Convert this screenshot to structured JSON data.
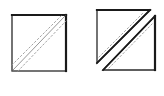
{
  "diagram": {
    "canvas": {
      "width": 164,
      "height": 96,
      "background": "#ffffff"
    },
    "colors": {
      "outline": "#2a2a2a",
      "outline_heavy": "#1a1a1a",
      "seam_line": "#8a8a8a",
      "stitch_dashes": "#9a9a9a"
    },
    "figures": [
      {
        "id": "whole-square",
        "description": "Square with diagonal seam line flanked by two dashed stitching lines",
        "square": {
          "x1": 12,
          "y1": 15,
          "x2": 66,
          "y2": 71
        },
        "seam": {
          "x1": 13,
          "y1": 70,
          "x2": 65,
          "y2": 16
        },
        "dashed_lines": [
          {
            "x1": 12,
            "y1": 65,
            "x2": 61,
            "y2": 16
          },
          {
            "x1": 18,
            "y1": 71,
            "x2": 66,
            "y2": 21
          }
        ]
      },
      {
        "id": "split-square",
        "description": "Same square cut along the diagonal into two separated triangles, each with a dashed stitching line",
        "triangles": [
          {
            "name": "upper-left-triangle",
            "points": [
              [
                97,
                10
              ],
              [
                150,
                10
              ],
              [
                97,
                63
              ]
            ],
            "dashed_line": {
              "x1": 99,
              "y1": 57,
              "x2": 144,
              "y2": 12
            }
          },
          {
            "name": "lower-right-triangle",
            "points": [
              [
                155,
                16
              ],
              [
                155,
                70
              ],
              [
                103,
                70
              ]
            ],
            "dashed_line": {
              "x1": 109,
              "y1": 68,
              "x2": 153,
              "y2": 23
            }
          }
        ]
      }
    ]
  }
}
